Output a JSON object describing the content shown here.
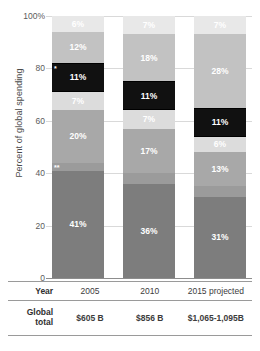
{
  "chart_data": {
    "type": "bar",
    "title": "",
    "xlabel": "",
    "ylabel": "Percent of global spending",
    "ylim": [
      0,
      100
    ],
    "grid": true,
    "legend": "none",
    "stacked": true,
    "categories": [
      "2005",
      "2010",
      "2015 projected"
    ],
    "ytick_labels": [
      "100%",
      "80",
      "60",
      "40",
      "20",
      "0"
    ],
    "ytick_values": [
      100,
      80,
      60,
      40,
      20,
      0
    ],
    "bars": [
      {
        "category": "2005",
        "segments": [
          {
            "label": "6%",
            "value": 6,
            "color": "#e8e8e8",
            "marker": ""
          },
          {
            "label": "12%",
            "value": 12,
            "color": "#c2c2c2",
            "marker": ""
          },
          {
            "label": "11%",
            "value": 11,
            "color": "#111111",
            "marker": "*"
          },
          {
            "label": "7%",
            "value": 7,
            "color": "#dcdcdc",
            "marker": ""
          },
          {
            "label": "20%",
            "value": 20,
            "color": "#a8a8a8",
            "marker": ""
          },
          {
            "label": "3%",
            "value": 3,
            "color": "#9b9b9b",
            "marker": "**"
          },
          {
            "label": "41%",
            "value": 41,
            "color": "#7d7d7d",
            "marker": ""
          }
        ]
      },
      {
        "category": "2010",
        "segments": [
          {
            "label": "7%",
            "value": 7,
            "color": "#e8e8e8",
            "marker": ""
          },
          {
            "label": "18%",
            "value": 18,
            "color": "#c2c2c2",
            "marker": ""
          },
          {
            "label": "11%",
            "value": 11,
            "color": "#111111",
            "marker": ""
          },
          {
            "label": "7%",
            "value": 7,
            "color": "#dcdcdc",
            "marker": ""
          },
          {
            "label": "17%",
            "value": 17,
            "color": "#a8a8a8",
            "marker": ""
          },
          {
            "label": "4%",
            "value": 4,
            "color": "#9b9b9b",
            "marker": ""
          },
          {
            "label": "36%",
            "value": 36,
            "color": "#7d7d7d",
            "marker": ""
          }
        ]
      },
      {
        "category": "2015 projected",
        "segments": [
          {
            "label": "7%",
            "value": 7,
            "color": "#e8e8e8",
            "marker": ""
          },
          {
            "label": "28%",
            "value": 28,
            "color": "#c2c2c2",
            "marker": ""
          },
          {
            "label": "11%",
            "value": 11,
            "color": "#111111",
            "marker": ""
          },
          {
            "label": "6%",
            "value": 6,
            "color": "#dcdcdc",
            "marker": ""
          },
          {
            "label": "13%",
            "value": 13,
            "color": "#a8a8a8",
            "marker": ""
          },
          {
            "label": "4%",
            "value": 4,
            "color": "#9b9b9b",
            "marker": ""
          },
          {
            "label": "31%",
            "value": 31,
            "color": "#7d7d7d",
            "marker": ""
          }
        ]
      }
    ]
  },
  "table": {
    "year_row_label": "Year",
    "total_row_label_line1": "Global",
    "total_row_label_line2": "total",
    "years": [
      "2005",
      "2010",
      "2015 projected"
    ],
    "totals": [
      "$605 B",
      "$856 B",
      "$1,065-1,095B"
    ]
  }
}
